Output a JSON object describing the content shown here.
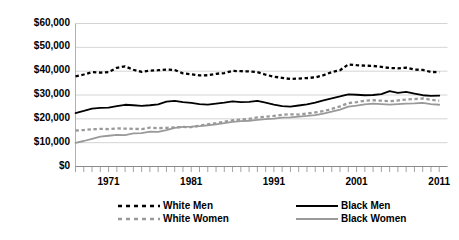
{
  "chart_data": {
    "type": "line",
    "title": "MEDIAN ANNUAL EARNINGS, 1967-2011 (IN 2011 DOLLARS)",
    "xlabel": "",
    "ylabel": "",
    "ylim": [
      0,
      60000
    ],
    "ytick_labels": [
      "$60,000",
      "$50,000",
      "$40,000",
      "$30,000",
      "$20,000",
      "$10,000",
      "$0"
    ],
    "ytick_values": [
      60000,
      50000,
      40000,
      30000,
      20000,
      10000,
      0
    ],
    "xlim": [
      1967,
      2012
    ],
    "xtick_labels": [
      "1971",
      "1981",
      "1991",
      "2001",
      "2011"
    ],
    "xtick_values": [
      1971,
      1981,
      1991,
      2001,
      2011
    ],
    "grid": "horizontal",
    "legend_position": "bottom",
    "x": [
      1967,
      1968,
      1969,
      1970,
      1971,
      1972,
      1973,
      1974,
      1975,
      1976,
      1977,
      1978,
      1979,
      1980,
      1981,
      1982,
      1983,
      1984,
      1985,
      1986,
      1987,
      1988,
      1989,
      1990,
      1991,
      1992,
      1993,
      1994,
      1995,
      1996,
      1997,
      1998,
      1999,
      2000,
      2001,
      2002,
      2003,
      2004,
      2005,
      2006,
      2007,
      2008,
      2009,
      2010,
      2011
    ],
    "series": [
      {
        "name": "White Men",
        "color": "#000000",
        "style": "dashed",
        "values": [
          37800,
          38600,
          39600,
          39400,
          39600,
          41400,
          42000,
          40600,
          39700,
          40200,
          40400,
          40700,
          40500,
          39100,
          38700,
          38200,
          38300,
          38900,
          39200,
          40100,
          40000,
          39900,
          39600,
          38500,
          37700,
          37200,
          36700,
          36900,
          37100,
          37400,
          38300,
          39600,
          40400,
          42800,
          42500,
          42300,
          42200,
          41800,
          41300,
          41200,
          41500,
          40700,
          40500,
          39700,
          39500
        ]
      },
      {
        "name": "Black Men",
        "color": "#000000",
        "style": "solid",
        "values": [
          22400,
          23300,
          24300,
          24600,
          24700,
          25300,
          25900,
          25700,
          25400,
          25700,
          26100,
          27200,
          27500,
          27000,
          26700,
          26200,
          26000,
          26400,
          26800,
          27300,
          27000,
          27100,
          27500,
          26800,
          26000,
          25300,
          25100,
          25600,
          26100,
          26800,
          27700,
          28600,
          29400,
          30300,
          30100,
          29900,
          30000,
          30400,
          31600,
          30900,
          31300,
          30600,
          29900,
          29600,
          29700
        ]
      },
      {
        "name": "White Women",
        "color": "#9a9a9a",
        "style": "dashed",
        "values": [
          15100,
          15300,
          15600,
          15800,
          15700,
          16000,
          15900,
          15800,
          15700,
          16300,
          16100,
          16200,
          16400,
          16600,
          16500,
          17100,
          17700,
          18200,
          18800,
          19400,
          19700,
          20000,
          20600,
          20900,
          21200,
          21700,
          21900,
          21800,
          22200,
          22700,
          23200,
          24200,
          25200,
          26600,
          27000,
          27600,
          27800,
          27600,
          27400,
          27700,
          28100,
          28300,
          28600,
          28000,
          27600
        ]
      },
      {
        "name": "Black Women",
        "color": "#9a9a9a",
        "style": "solid",
        "values": [
          9900,
          10700,
          11600,
          12500,
          12900,
          13300,
          13200,
          13900,
          14000,
          14600,
          14500,
          15300,
          16200,
          16600,
          16700,
          16900,
          17300,
          17700,
          18200,
          18700,
          19000,
          19200,
          19600,
          19900,
          20100,
          20500,
          20600,
          20900,
          21200,
          21600,
          22200,
          23000,
          23900,
          25100,
          25500,
          26100,
          26400,
          26200,
          26000,
          26200,
          26400,
          26500,
          26700,
          26200,
          25900
        ]
      }
    ]
  },
  "axis": {
    "y_ticks": [
      "$60,000",
      "$50,000",
      "$40,000",
      "$30,000",
      "$20,000",
      "$10,000",
      "$0"
    ],
    "x_ticks": [
      "1971",
      "1981",
      "1991",
      "2001",
      "2011"
    ]
  },
  "legend": {
    "items": [
      {
        "label": "White Men",
        "color": "#000000",
        "style": "dashed"
      },
      {
        "label": "Black Men",
        "color": "#000000",
        "style": "solid"
      },
      {
        "label": "White Women",
        "color": "#9a9a9a",
        "style": "dashed"
      },
      {
        "label": "Black Women",
        "color": "#9a9a9a",
        "style": "solid"
      }
    ]
  }
}
